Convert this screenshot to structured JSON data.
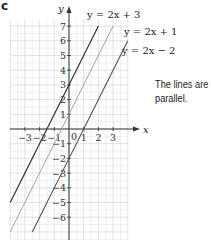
{
  "part_label": "c",
  "note": [
    "The lines are",
    "parallel."
  ],
  "chart_data": {
    "type": "line",
    "title": "",
    "xlabel": "x",
    "ylabel": "y",
    "xlim": [
      -4,
      4
    ],
    "ylim": [
      -7.5,
      7.5
    ],
    "grid": true,
    "x_ticks": [
      -3,
      -2,
      -1,
      0,
      1,
      2,
      3
    ],
    "y_ticks": [
      7,
      6,
      5,
      4,
      3,
      2,
      1,
      -1,
      -2,
      -3,
      -4,
      -5,
      -6
    ],
    "series": [
      {
        "name": "y = 2x + 3",
        "slope": 2,
        "intercept": 3,
        "color": "#333333",
        "points": [
          [
            -4,
            -5
          ],
          [
            2,
            7
          ]
        ]
      },
      {
        "name": "y = 2x + 1",
        "slope": 2,
        "intercept": 1,
        "color": "#9a9a9a",
        "points": [
          [
            -4,
            -7
          ],
          [
            3,
            7
          ]
        ]
      },
      {
        "name": "y = 2x − 2",
        "slope": 2,
        "intercept": -2,
        "color": "#555555",
        "points": [
          [
            -2.5,
            -7
          ],
          [
            4,
            6
          ]
        ]
      }
    ],
    "annotations": [
      "The lines are parallel."
    ]
  },
  "labels": {
    "line1": "y = 2x + 3",
    "line2": "y = 2x + 1",
    "line3": "y = 2x − 2",
    "x_axis": "x",
    "y_axis": "y",
    "origin": "0"
  }
}
